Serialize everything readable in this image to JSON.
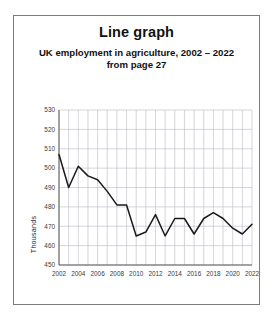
{
  "card": {
    "title": "Line graph",
    "subtitle_line1": "UK employment in agriculture, 2002 – 2022",
    "subtitle_line2": "from page 27"
  },
  "chart_data": {
    "type": "line",
    "title": "Line graph",
    "subtitle": "UK employment in agriculture, 2002 – 2022 from page 27",
    "xlabel": "",
    "ylabel": "Thousands",
    "ylim": [
      450,
      530
    ],
    "xlim": [
      2002,
      2022
    ],
    "y_ticks": [
      450,
      460,
      470,
      480,
      490,
      500,
      510,
      520,
      530
    ],
    "x_ticks": [
      2002,
      2004,
      2006,
      2008,
      2010,
      2012,
      2014,
      2016,
      2018,
      2020,
      2022
    ],
    "grid": true,
    "legend": "none",
    "line_color": "#1a1a1a",
    "grid_color": "#b9b9c4",
    "x": [
      2002,
      2003,
      2004,
      2005,
      2006,
      2007,
      2008,
      2009,
      2010,
      2011,
      2012,
      2013,
      2014,
      2015,
      2016,
      2017,
      2018,
      2019,
      2020,
      2021,
      2022
    ],
    "values": [
      507,
      490,
      501,
      496,
      494,
      488,
      481,
      481,
      465,
      467,
      476,
      465,
      474,
      474,
      466,
      474,
      477,
      474,
      469,
      466,
      471
    ],
    "series": [
      {
        "name": "UK employment in agriculture",
        "values": [
          507,
          490,
          501,
          496,
          494,
          488,
          481,
          481,
          465,
          467,
          476,
          465,
          474,
          474,
          466,
          474,
          477,
          474,
          469,
          466,
          471
        ]
      }
    ]
  }
}
